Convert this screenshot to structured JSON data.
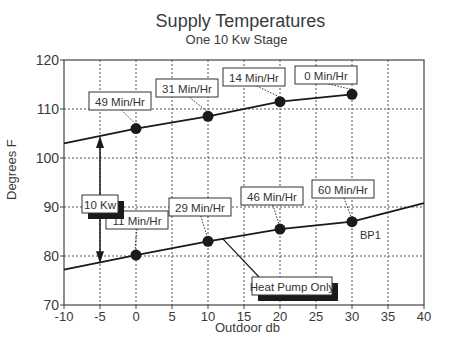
{
  "chart_data": {
    "type": "line",
    "title": "Supply Temperatures",
    "subtitle": "One 10 Kw Stage",
    "xlabel": "Outdoor db",
    "ylabel": "Degrees F",
    "xlim": [
      -10,
      40
    ],
    "ylim": [
      70,
      120
    ],
    "xticks": [
      -10,
      -5,
      0,
      5,
      10,
      15,
      20,
      25,
      30,
      35,
      40
    ],
    "yticks": [
      70,
      80,
      90,
      100,
      110,
      120
    ],
    "grid": true,
    "grid_style": "dotted",
    "series": [
      {
        "name": "10 Kw stage",
        "line": [
          [
            -10,
            103
          ],
          [
            0,
            106
          ],
          [
            10,
            108.5
          ],
          [
            20,
            111.5
          ],
          [
            30,
            113
          ]
        ],
        "markers": [
          [
            0,
            106
          ],
          [
            10,
            108.5
          ],
          [
            20,
            111.5
          ],
          [
            30,
            113
          ]
        ],
        "labels": [
          "49 Min/Hr",
          "31 Min/Hr",
          "14 Min/Hr",
          "0 Min/Hr"
        ]
      },
      {
        "name": "Heat Pump Only",
        "line": [
          [
            -10,
            77.2
          ],
          [
            0,
            80.2
          ],
          [
            10,
            83
          ],
          [
            20,
            85.5
          ],
          [
            30,
            87
          ],
          [
            40,
            90.8
          ]
        ],
        "markers": [
          [
            0,
            80.2
          ],
          [
            10,
            83
          ],
          [
            20,
            85.5
          ],
          [
            30,
            87
          ]
        ],
        "labels": [
          "11 Min/Hr",
          "29 Min/Hr",
          "46 Min/Hr",
          "60 Min/Hr"
        ]
      }
    ],
    "annotations": [
      {
        "text": "10 Kw",
        "type": "double-arrow",
        "x": -5,
        "from": 104.5,
        "to": 78.5
      },
      {
        "text": "Heat Pump Only",
        "type": "callout",
        "target": [
          12,
          84
        ]
      },
      {
        "text": "BP1",
        "type": "point-label",
        "at": [
          30,
          87
        ]
      }
    ]
  },
  "labels": {
    "title": "Supply Temperatures",
    "subtitle": "One 10 Kw Stage",
    "xlabel": "Outdoor db",
    "ylabel": "Degrees F"
  },
  "colors": {
    "line": "#1a1a1a",
    "grid": "#555555",
    "text": "#3a3a3a",
    "shadow": "#1a1a1a"
  }
}
